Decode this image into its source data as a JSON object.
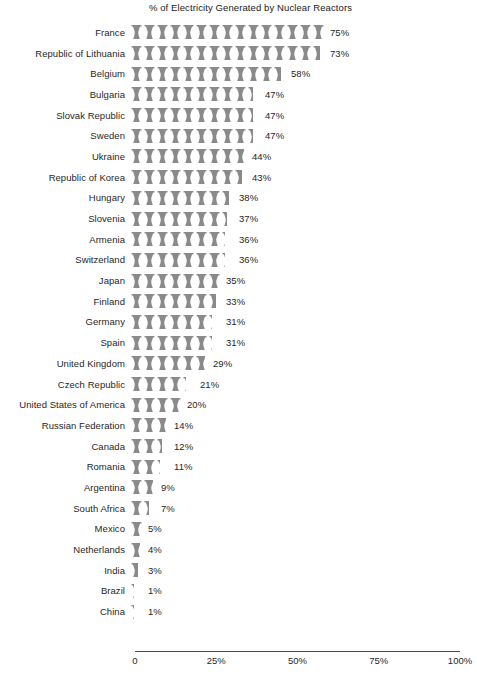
{
  "chart_data": {
    "type": "bar",
    "subtype": "pictogram",
    "title": "% of Electricity Generated by Nuclear Reactors",
    "xlabel": "",
    "ylabel": "",
    "xlim": [
      0,
      100
    ],
    "grid": false,
    "legend": null,
    "icon_unit": 5,
    "icon_name": "cooling-tower-icon",
    "icon_color": "#8a8a8a",
    "axis_color": "#4a4a4a",
    "value_suffix": "%",
    "tick_labels": [
      "0",
      "25%",
      "50%",
      "75%",
      "100%"
    ],
    "tick_values": [
      0,
      25,
      50,
      75,
      100
    ],
    "categories": [
      "France",
      "Republic of Lithuania",
      "Belgium",
      "Bulgaria",
      "Slovak Republic",
      "Sweden",
      "Ukraine",
      "Republic of Korea",
      "Hungary",
      "Slovenia",
      "Armenia",
      "Switzerland",
      "Japan",
      "Finland",
      "Germany",
      "Spain",
      "United Kingdom",
      "Czech Republic",
      "United States of America",
      "Russian Federation",
      "Canada",
      "Romania",
      "Argentina",
      "South Africa",
      "Mexico",
      "Netherlands",
      "India",
      "Brazil",
      "China"
    ],
    "values": [
      75,
      73,
      58,
      47,
      47,
      47,
      44,
      43,
      38,
      37,
      36,
      36,
      35,
      33,
      31,
      31,
      29,
      21,
      20,
      14,
      12,
      11,
      9,
      7,
      5,
      4,
      3,
      1,
      1
    ],
    "value_labels": [
      "75%",
      "73%",
      "58%",
      "47%",
      "47%",
      "47%",
      "44%",
      "43%",
      "38%",
      "37%",
      "36%",
      "36%",
      "35%",
      "33%",
      "31%",
      "31%",
      "29%",
      "21%",
      "20%",
      "14%",
      "12%",
      "11%",
      "9%",
      "7%",
      "5%",
      "4%",
      "3%",
      "1%",
      "1%"
    ]
  }
}
